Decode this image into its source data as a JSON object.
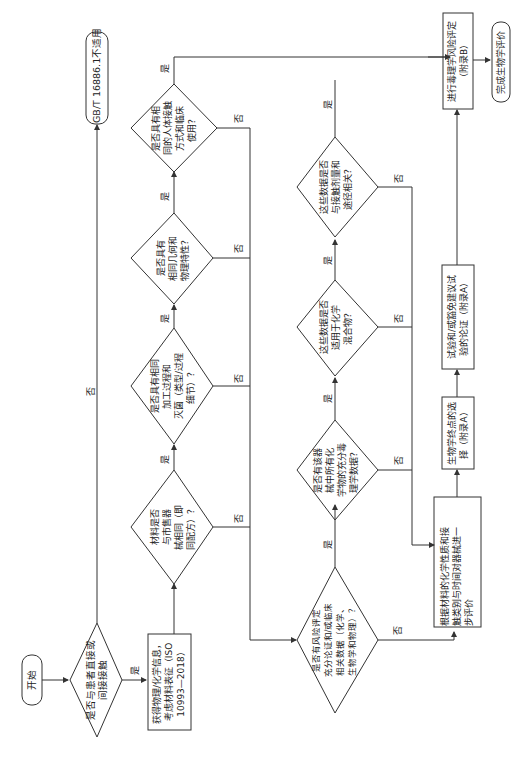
{
  "flowchart": {
    "orientation": "rotated-90-ccw",
    "start": {
      "label": "开始"
    },
    "end_na": {
      "label": "GB/T 16886.1不适用"
    },
    "end_done": {
      "label": "完成生物学评价"
    },
    "decisions": {
      "contact": {
        "lines": [
          "是否与患者直接或",
          "间接接触"
        ]
      },
      "same_material": {
        "lines": [
          "材料是否",
          "与市售器",
          "械相同（即",
          "同配方）？"
        ]
      },
      "same_process": {
        "lines": [
          "是否具有相同",
          "加工过程和",
          "灭菌（类型/过程",
          "细节）？"
        ]
      },
      "same_geometry": {
        "lines": [
          "是否具有",
          "相同几何和",
          "物理特性？"
        ]
      },
      "same_contact": {
        "lines": [
          "是否具有相",
          "同的人体接触",
          "方式和临床",
          "使用？"
        ]
      },
      "risk_data": {
        "lines": [
          "是否有风险评定",
          "充分论证和/或临床",
          "相关数据（化学、",
          "生物学和物理）？"
        ]
      },
      "tox_data": {
        "lines": [
          "是否有该器",
          "械中所有化",
          "学物的充分毒",
          "理学数据？"
        ]
      },
      "mixture": {
        "lines": [
          "这些数据是否",
          "适用于化学",
          "混合物？"
        ]
      },
      "dose_route": {
        "lines": [
          "这些数据是否",
          "与接触剂量和",
          "途径相关？"
        ]
      }
    },
    "processes": {
      "characterize": {
        "lines": [
          "获得物理/化学信息，",
          "考虑材料表征（ISO",
          "10993—2018）"
        ]
      },
      "evaluate": {
        "lines": [
          "根据材料的化学性质和接",
          "触类别与时间对器械进一",
          "步评价"
        ]
      },
      "endpoints": {
        "lines": [
          "生物学终点的选",
          "择（附录A）"
        ]
      },
      "tests": {
        "lines": [
          "试验和/或豁免建议试",
          "验的论证（附录A）"
        ]
      },
      "tox_risk": {
        "lines": [
          "进行毒理学风险评定",
          "（附录B）"
        ]
      }
    },
    "edge_labels": {
      "yes": "是",
      "no": "否"
    },
    "line_color": "#333333"
  }
}
